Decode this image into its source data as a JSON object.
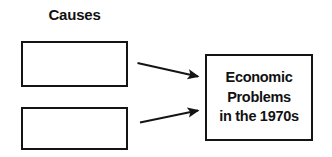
{
  "diagram": {
    "type": "cause-and-effect-chart",
    "background_color": "#ffffff",
    "stroke_color": "#141414",
    "text_color": "#111111",
    "column_heading": "Causes",
    "cause_boxes": [
      {
        "label": "",
        "note": "blank fill-in box"
      },
      {
        "label": "",
        "note": "blank fill-in box"
      }
    ],
    "effect_box": {
      "lines": [
        "Economic",
        "Problems",
        "in the 1970s"
      ]
    },
    "arrows": [
      {
        "name": "arrow-cause-1-to-effect",
        "direction": "right-down"
      },
      {
        "name": "arrow-cause-2-to-effect",
        "direction": "right-up"
      }
    ]
  }
}
